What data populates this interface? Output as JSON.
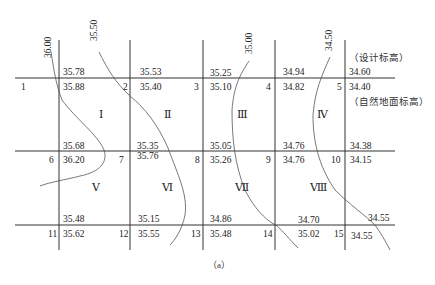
{
  "figure": {
    "caption": "（a）",
    "legend": {
      "design_elevation_label": "（设计标高）",
      "natural_elevation_label": "（自然地面标高）"
    },
    "nodes": [
      {
        "id": "1",
        "design": "35.78",
        "natural": "35.88"
      },
      {
        "id": "2",
        "design": "35.53",
        "natural": "35.40"
      },
      {
        "id": "3",
        "design": "35.25",
        "natural": "35.10"
      },
      {
        "id": "4",
        "design": "34.94",
        "natural": "34.82"
      },
      {
        "id": "5",
        "design": "34.60",
        "natural": "34.40"
      },
      {
        "id": "6",
        "design": "35.68",
        "natural": "36.20"
      },
      {
        "id": "7",
        "design": "35.35",
        "natural": "35.76"
      },
      {
        "id": "8",
        "design": "35.05",
        "natural": "35.26"
      },
      {
        "id": "9",
        "design": "34.76",
        "natural": "34.76"
      },
      {
        "id": "10",
        "design": "34.38",
        "natural": "34.15"
      },
      {
        "id": "11",
        "design": "35.48",
        "natural": "35.62"
      },
      {
        "id": "12",
        "design": "35.15",
        "natural": "35.55"
      },
      {
        "id": "13",
        "design": "34.86",
        "natural": "35.48"
      },
      {
        "id": "14",
        "design": "34.70",
        "natural": "35.02"
      },
      {
        "id": "15",
        "design": "34.55",
        "natural": "34.55"
      }
    ],
    "cells": [
      "Ⅰ",
      "Ⅱ",
      "Ⅲ",
      "Ⅳ",
      "Ⅴ",
      "Ⅵ",
      "Ⅶ",
      "Ⅷ"
    ],
    "contours": [
      "36.00",
      "35.50",
      "35.00",
      "34.50"
    ]
  }
}
